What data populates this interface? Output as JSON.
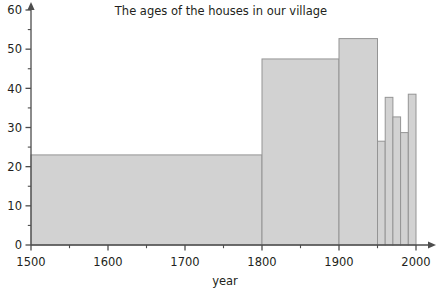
{
  "chart_data": {
    "type": "bar",
    "title": "The ages of the houses in our village",
    "xlabel": "year",
    "ylabel": "",
    "xlim": [
      1500,
      2000
    ],
    "ylim": [
      0,
      60
    ],
    "grid": false,
    "legend": null,
    "x_tick_labels": [
      "1500",
      "1600",
      "1700",
      "1800",
      "1900",
      "2000"
    ],
    "x_tick_values": [
      1500,
      1600,
      1700,
      1800,
      1900,
      2000
    ],
    "x_minor_tick_values": [
      1550,
      1650,
      1750,
      1850,
      1950
    ],
    "y_tick_labels": [
      "0",
      "10",
      "20",
      "30",
      "40",
      "50",
      "60"
    ],
    "y_tick_values": [
      0,
      10,
      20,
      30,
      40,
      50,
      60
    ],
    "y_minor_tick_values": [
      5,
      15,
      25,
      35,
      45,
      55
    ],
    "bin_edges": [
      1500,
      1800,
      1900,
      1950,
      1960,
      1970,
      1980,
      1990,
      2000
    ],
    "categories": [
      "1500-1800",
      "1800-1900",
      "1900-1950",
      "1950-1960",
      "1960-1970",
      "1970-1980",
      "1980-1990",
      "1990-2000"
    ],
    "values": [
      23,
      47.5,
      52.7,
      26.5,
      37.7,
      32.7,
      28.7,
      38.5
    ],
    "bar_fill_color": "#d2d2d2",
    "bar_stroke_color": "#949494",
    "axis_color": "#4d4d4d",
    "text_color": "#231f20",
    "background_color": "#ffffff"
  }
}
